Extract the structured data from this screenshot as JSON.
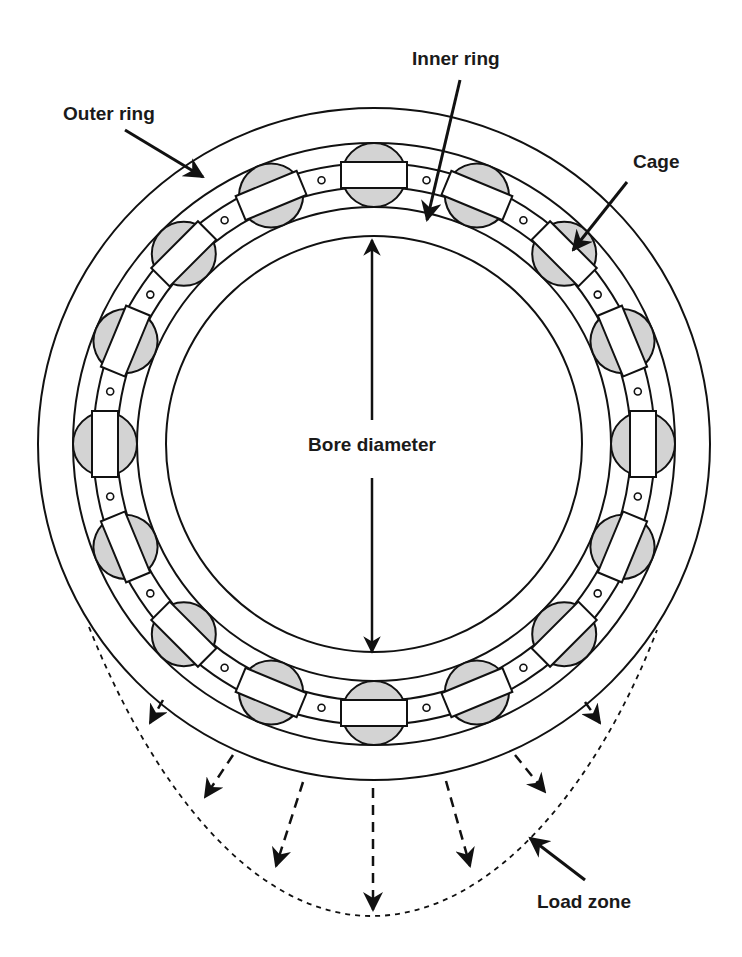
{
  "diagram": {
    "type": "cylindrical-roller-bearing-cross-section",
    "center": {
      "x": 374,
      "y": 444
    },
    "radii": {
      "outer_ring_outer": 336,
      "outer_ring_inner": 301,
      "cage_outer": 281,
      "cage_inner": 257,
      "inner_ring_outer": 237,
      "bore": 208,
      "roller_pitch": 269,
      "roller": 32
    },
    "roller_count": 16,
    "colors": {
      "stroke": "#111111",
      "roller_fill": "#d3d3d3",
      "background": "#ffffff",
      "text": "#1a1a1a"
    }
  },
  "labels": {
    "outer_ring": "Outer ring",
    "inner_ring": "Inner ring",
    "cage": "Cage",
    "bore_diameter": "Bore diameter",
    "load_zone": "Load zone"
  }
}
